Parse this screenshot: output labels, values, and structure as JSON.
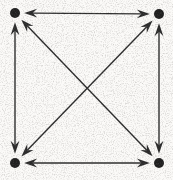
{
  "figure": {
    "caption": "K4 drawn as a square with both diagonals; every edge carries an arrowhead at each end",
    "background_color": "#fbfaf8",
    "ink_color": "#2b2b2b",
    "stroke_width": 1.4,
    "vertex_radius": 5,
    "arrowhead_length": 13,
    "arrowhead_half_width": 4.4,
    "arrowhead_barb_inset": 4.5,
    "canvas": {
      "width": 173,
      "height": 180
    }
  },
  "chart_data": {
    "type": "diagram",
    "graph_type": "complete-bidirectional-digraph",
    "notation": "K4",
    "vertex_count": 4,
    "edge_count": 6,
    "arc_count": 12,
    "directed": true,
    "bidirectional": true,
    "grid": false,
    "legend": false,
    "vertices": [
      {
        "id": "TL",
        "label": "",
        "x": 15,
        "y": 13,
        "corner": "top-left"
      },
      {
        "id": "TR",
        "label": "",
        "x": 159,
        "y": 14,
        "corner": "top-right"
      },
      {
        "id": "BL",
        "label": "",
        "x": 15,
        "y": 163,
        "corner": "bottom-left"
      },
      {
        "id": "BR",
        "label": "",
        "x": 159,
        "y": 163,
        "corner": "bottom-right"
      }
    ],
    "edges": [
      {
        "id": "top",
        "from": "TL",
        "to": "TR",
        "kind": "side",
        "orientation": "horizontal",
        "arrows": "both"
      },
      {
        "id": "bottom",
        "from": "BL",
        "to": "BR",
        "kind": "side",
        "orientation": "horizontal",
        "arrows": "both"
      },
      {
        "id": "left",
        "from": "TL",
        "to": "BL",
        "kind": "side",
        "orientation": "vertical",
        "arrows": "both"
      },
      {
        "id": "right",
        "from": "TR",
        "to": "BR",
        "kind": "side",
        "orientation": "vertical",
        "arrows": "both"
      },
      {
        "id": "diag-nw-se",
        "from": "TL",
        "to": "BR",
        "kind": "diagonal",
        "orientation": "descending",
        "arrows": "both"
      },
      {
        "id": "diag-ne-sw",
        "from": "TR",
        "to": "BL",
        "kind": "diagonal",
        "orientation": "ascending",
        "arrows": "both"
      }
    ],
    "crossing_point": {
      "x": 87,
      "y": 88
    },
    "arrowheads_per_vertex": 3,
    "arrowhead_style": "swept-back barbed dart, pointing inward toward each vertex"
  }
}
